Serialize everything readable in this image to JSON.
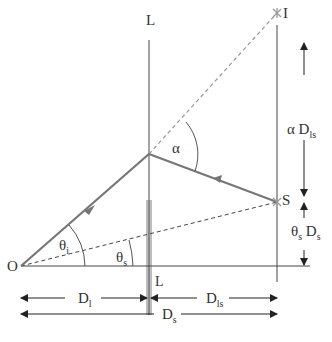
{
  "diagram": {
    "colors": {
      "line": "#666666",
      "ray": "#777777",
      "dashed": "#999999",
      "lens_band": "#bdbdbd",
      "text": "#333333",
      "arrow": "#222222"
    },
    "labels": {
      "lens_top": "L",
      "lens_bottom": "L",
      "observer": "O",
      "image": "I",
      "source": "S",
      "alpha": "α",
      "theta_i_main": "θ",
      "theta_i_sub": "i",
      "theta_s_main": "θ",
      "theta_s_sub": "s",
      "alpha_dls_main": "α D",
      "alpha_dls_sub": "ls",
      "thetas_ds_main1": "θ",
      "thetas_ds_sub1": "s",
      "thetas_ds_main2": " D",
      "thetas_ds_sub2": "s",
      "dl_main": "D",
      "dl_sub": "l",
      "dls_main": "D",
      "dls_sub": "ls",
      "ds_main": "D",
      "ds_sub": "s"
    }
  }
}
